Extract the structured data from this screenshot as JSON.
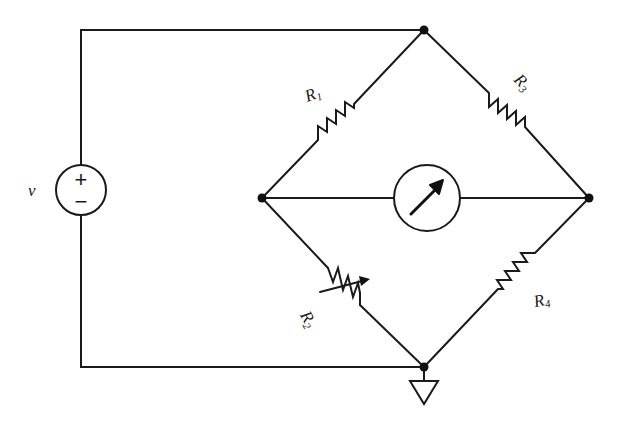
{
  "diagram": {
    "type": "Wheatstone bridge circuit",
    "source": {
      "label": "v",
      "plus": "+",
      "minus": "−"
    },
    "resistors": [
      {
        "id": "R1",
        "label": "R",
        "sub": "1",
        "branch": "top-left"
      },
      {
        "id": "R3",
        "label": "R",
        "sub": "3",
        "branch": "top-right"
      },
      {
        "id": "R2",
        "label": "R",
        "sub": "2",
        "branch": "bottom-left",
        "variable": true
      },
      {
        "id": "R4",
        "label": "R",
        "sub": "4",
        "branch": "bottom-right"
      }
    ],
    "meter": {
      "name": "galvanometer",
      "branch": "center"
    },
    "ground": {
      "node": "bottom"
    },
    "colors": {
      "stroke": "#1a1a1a",
      "background": "#ffffff"
    }
  }
}
